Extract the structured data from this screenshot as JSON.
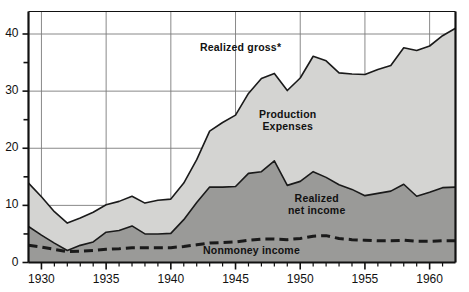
{
  "chart_data": {
    "type": "area",
    "title": "",
    "subtitle": "",
    "xlabel": "",
    "ylabel": "",
    "xlim": [
      1929,
      1962
    ],
    "ylim": [
      0,
      44
    ],
    "grid": true,
    "legend_position": "inline-annotations",
    "y_ticks_major": [
      0,
      10,
      20,
      30,
      40
    ],
    "y_ticks_minor": [
      5,
      15,
      25,
      35
    ],
    "x_ticks_major": [
      1930,
      1935,
      1940,
      1945,
      1950,
      1955,
      1960
    ],
    "x_tick_labels": [
      "1930",
      "1935",
      "1940",
      "1945",
      "1950",
      "1955",
      "1960"
    ],
    "x": [
      1929,
      1930,
      1931,
      1932,
      1933,
      1934,
      1935,
      1936,
      1937,
      1938,
      1939,
      1940,
      1941,
      1942,
      1943,
      1944,
      1945,
      1946,
      1947,
      1948,
      1949,
      1950,
      1951,
      1952,
      1953,
      1954,
      1955,
      1956,
      1957,
      1958,
      1959,
      1960,
      1961,
      1962
    ],
    "series": [
      {
        "name": "Realized gross*",
        "fill": "#d4d4d2",
        "values": [
          13.9,
          11.5,
          8.9,
          6.9,
          7.8,
          8.8,
          10.1,
          10.7,
          11.6,
          10.4,
          10.9,
          11.1,
          13.9,
          18.0,
          23.0,
          24.5,
          25.8,
          29.6,
          32.2,
          33.1,
          30.1,
          32.3,
          36.1,
          35.3,
          33.2,
          33.0,
          32.9,
          33.8,
          34.5,
          37.6,
          37.1,
          37.9,
          39.7,
          41.0
        ]
      },
      {
        "name": "Realized net income",
        "fill": "#9a9a98",
        "values": [
          6.3,
          4.8,
          3.4,
          2.1,
          3.0,
          3.6,
          5.3,
          5.6,
          6.4,
          5.0,
          5.0,
          5.1,
          7.5,
          10.5,
          13.2,
          13.2,
          13.3,
          15.6,
          15.9,
          17.8,
          13.5,
          14.2,
          15.9,
          14.9,
          13.6,
          12.8,
          11.7,
          12.1,
          12.5,
          13.7,
          11.6,
          12.3,
          13.1,
          13.2
        ]
      }
    ],
    "dashed_line": {
      "name": "Nonmoney income",
      "values": [
        3.0,
        2.7,
        2.3,
        1.9,
        2.0,
        2.1,
        2.3,
        2.4,
        2.6,
        2.6,
        2.6,
        2.6,
        2.8,
        3.1,
        3.4,
        3.5,
        3.6,
        3.9,
        4.1,
        4.1,
        4.0,
        4.2,
        4.6,
        4.7,
        4.2,
        4.0,
        3.9,
        3.8,
        3.8,
        3.9,
        3.7,
        3.7,
        3.8,
        3.8
      ]
    },
    "annotations": [
      {
        "id": "realized-gross",
        "text": "Realized  gross*",
        "x_px": 200,
        "y_px": 41
      },
      {
        "id": "production-expenses",
        "text": "Production\nExpenses",
        "line1": "Production",
        "line2": "Expenses",
        "x_px": 259,
        "y_px": 108
      },
      {
        "id": "realized-net-income",
        "text": "Realized\nnet income",
        "line1": "Realized",
        "line2": "net income",
        "x_px": 288,
        "y_px": 192
      },
      {
        "id": "nonmoney-income",
        "text": "Nonmoney  income",
        "x_px": 203,
        "y_px": 244
      }
    ],
    "colors": {
      "gross_fill": "#d4d4d2",
      "net_fill": "#9a9a98",
      "line": "#1a1a1a",
      "grid": "#7c7c7c",
      "axis": "#111111",
      "background": "#ffffff",
      "text": "#111111"
    }
  },
  "axis": {
    "y_labels": [
      "0",
      "10",
      "20",
      "30",
      "40"
    ],
    "x_labels": [
      "1930",
      "1935",
      "1940",
      "1945",
      "1950",
      "1955",
      "1960"
    ]
  },
  "labels": {
    "realized_gross": "Realized  gross*",
    "production_expenses_line1": "Production",
    "production_expenses_line2": "Expenses",
    "realized_net_line1": "Realized",
    "realized_net_line2": "net income",
    "nonmoney_income": "Nonmoney  income"
  }
}
